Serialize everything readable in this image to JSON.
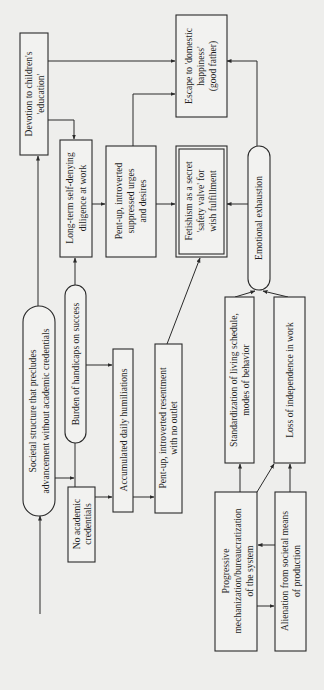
{
  "diagram": {
    "orientation": "rotated-90-ccw",
    "nodes": {
      "societal": {
        "lines": [
          "Societal structure that precludes",
          "advancement without academic credentials"
        ],
        "shape": "rounded"
      },
      "no_credentials": {
        "lines": [
          "No academic",
          "credentials"
        ],
        "shape": "rect"
      },
      "burden": {
        "lines": [
          "Burden of handicaps on success"
        ],
        "shape": "rounded"
      },
      "accumulated": {
        "lines": [
          "Accumulated daily humiliations"
        ],
        "shape": "rect"
      },
      "resentment": {
        "lines": [
          "Pent-up, introverted resentment",
          "with no outlet"
        ],
        "shape": "rect"
      },
      "devotion": {
        "lines": [
          "Devotion to children's",
          "'education'"
        ],
        "shape": "rect"
      },
      "longterm": {
        "lines": [
          "Long-term self-denying",
          "diligence at work"
        ],
        "shape": "rect"
      },
      "urges": {
        "lines": [
          "Pent-up, introverted",
          "suppressed urges",
          "and desires"
        ],
        "shape": "rect"
      },
      "fetishism": {
        "lines": [
          "Fetishism as a secret",
          "'safety valve' for",
          "wish fulfillment"
        ],
        "shape": "double-rect"
      },
      "escape": {
        "lines": [
          "Escape to 'domestic",
          "happiness'",
          "(good father)"
        ],
        "shape": "rect"
      },
      "exhaustion": {
        "lines": [
          "Emotional exhaustion"
        ],
        "shape": "rounded"
      },
      "standardization": {
        "lines": [
          "Standardization of living schedule,",
          "modes of behavior"
        ],
        "shape": "rect"
      },
      "independence": {
        "lines": [
          "Loss of independence in work"
        ],
        "shape": "rect"
      },
      "progressive": {
        "lines": [
          "Progressive",
          "mechanization/bureaucratization",
          "of the system"
        ],
        "shape": "rect"
      },
      "alienation": {
        "lines": [
          "Alienation from societal means",
          "of production"
        ],
        "shape": "rect"
      }
    },
    "edges": [
      {
        "from": "input",
        "to": "societal"
      },
      {
        "from": "societal",
        "to": "devotion"
      },
      {
        "from": "societal",
        "to": "burden"
      },
      {
        "from": "no_credentials",
        "to": "burden"
      },
      {
        "from": "no_credentials",
        "to": "accumulated"
      },
      {
        "from": "burden",
        "to": "longterm"
      },
      {
        "from": "burden",
        "to": "accumulated"
      },
      {
        "from": "accumulated",
        "to": "resentment"
      },
      {
        "from": "resentment",
        "to": "fetishism"
      },
      {
        "from": "devotion",
        "to": "longterm"
      },
      {
        "from": "devotion",
        "to": "escape"
      },
      {
        "from": "longterm",
        "to": "urges"
      },
      {
        "from": "urges",
        "to": "fetishism"
      },
      {
        "from": "urges",
        "to": "escape"
      },
      {
        "from": "exhaustion",
        "to": "fetishism"
      },
      {
        "from": "exhaustion",
        "to": "escape"
      },
      {
        "from": "standardization",
        "to": "exhaustion"
      },
      {
        "from": "independence",
        "to": "exhaustion"
      },
      {
        "from": "progressive",
        "to": "standardization"
      },
      {
        "from": "progressive",
        "to": "independence"
      },
      {
        "from": "progressive",
        "to": "alienation"
      },
      {
        "from": "alienation",
        "to": "progressive"
      },
      {
        "from": "alienation",
        "to": "independence"
      }
    ]
  }
}
